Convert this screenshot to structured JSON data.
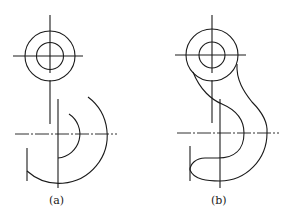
{
  "figures": [
    {
      "id": "a",
      "caption": "(a)",
      "description": "Hook outline construction step: circle and concentric arcs"
    },
    {
      "id": "b",
      "caption": "(b)",
      "description": "Completed hook outline with tangent connecting curves"
    }
  ],
  "colors": {
    "line": "#1a1a1a",
    "background": "#ffffff"
  }
}
